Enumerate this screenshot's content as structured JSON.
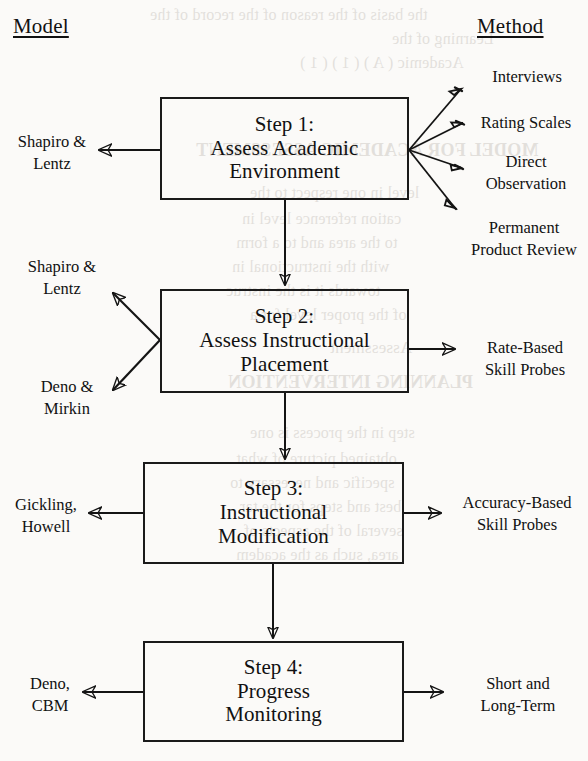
{
  "page": {
    "width": 588,
    "height": 761,
    "background_color": "#fbfaf8",
    "ink_color": "#141414"
  },
  "headers": {
    "left": "Model",
    "right": "Method"
  },
  "steps": [
    {
      "id": "step-1",
      "line1": "Step 1:",
      "line2": "Assess Academic",
      "line3": "Environment"
    },
    {
      "id": "step-2",
      "line1": "Step 2:",
      "line2": "Assess Instructional",
      "line3": "Placement"
    },
    {
      "id": "step-3",
      "line1": "Step 3:",
      "line2": "Instructional",
      "line3": "Modification"
    },
    {
      "id": "step-4",
      "line1": "Step 4:",
      "line2": "Progress",
      "line3": "Monitoring"
    }
  ],
  "model_labels": [
    {
      "id": "model-1",
      "line1": "Shapiro &",
      "line2": "Lentz"
    },
    {
      "id": "model-2",
      "line1": "Shapiro &",
      "line2": "Lentz"
    },
    {
      "id": "model-3",
      "line1": "Deno &",
      "line2": "Mirkin"
    },
    {
      "id": "model-4",
      "line1": "Gickling,",
      "line2": "Howell"
    },
    {
      "id": "model-5",
      "line1": "Deno,",
      "line2": "CBM"
    }
  ],
  "method_labels": [
    {
      "id": "method-1",
      "line1": "Interviews",
      "line2": ""
    },
    {
      "id": "method-2",
      "line1": "Rating Scales",
      "line2": ""
    },
    {
      "id": "method-3",
      "line1": "Direct",
      "line2": "Observation"
    },
    {
      "id": "method-4",
      "line1": "Permanent",
      "line2": "Product Review"
    },
    {
      "id": "method-5",
      "line1": "Rate-Based",
      "line2": "Skill Probes"
    },
    {
      "id": "method-6",
      "line1": "Accuracy-Based",
      "line2": "Skill Probes"
    },
    {
      "id": "method-7",
      "line1": "Short and",
      "line2": "Long-Term"
    }
  ],
  "bleed_text": {
    "note": "faint mirrored show-through text from the reverse side of the printed page",
    "lines": [
      {
        "text": "the basis of the reason of the record of the",
        "x": 150,
        "y": 6,
        "size": 16,
        "bold": false
      },
      {
        "text": "Learning of the",
        "x": 392,
        "y": 30,
        "size": 16,
        "bold": false
      },
      {
        "text": "Academic ( A ) ( 1 ) ( 1 )",
        "x": 300,
        "y": 54,
        "size": 16,
        "bold": false
      },
      {
        "text": "MODEL FOR ACADEMIC ASSESSMENT",
        "x": 196,
        "y": 140,
        "size": 18,
        "bold": true
      },
      {
        "text": "level in one respect to the",
        "x": 250,
        "y": 184,
        "size": 16,
        "bold": false
      },
      {
        "text": "cation reference level in",
        "x": 242,
        "y": 210,
        "size": 16,
        "bold": false
      },
      {
        "text": "to the area and to a form",
        "x": 236,
        "y": 234,
        "size": 16,
        "bold": false
      },
      {
        "text": "with the instructional in",
        "x": 232,
        "y": 258,
        "size": 16,
        "bold": false
      },
      {
        "text": "towards it is the instruc",
        "x": 226,
        "y": 282,
        "size": 16,
        "bold": false
      },
      {
        "text": "of the proper level for a",
        "x": 250,
        "y": 306,
        "size": 16,
        "bold": false
      },
      {
        "text": "Assessment",
        "x": 330,
        "y": 338,
        "size": 17,
        "bold": false
      },
      {
        "text": "PLANNING INTERVENTION",
        "x": 228,
        "y": 372,
        "size": 18,
        "bold": true
      },
      {
        "text": "step in the process is one",
        "x": 250,
        "y": 424,
        "size": 16,
        "bold": false
      },
      {
        "text": "obtained picture of what",
        "x": 236,
        "y": 450,
        "size": 16,
        "bold": false
      },
      {
        "text": "specific and necessary to",
        "x": 230,
        "y": 474,
        "size": 16,
        "bold": false
      },
      {
        "text": "best and steps for the tar",
        "x": 240,
        "y": 498,
        "size": 16,
        "bold": false
      },
      {
        "text": "several of the aspects of",
        "x": 244,
        "y": 522,
        "size": 16,
        "bold": false
      },
      {
        "text": "area, such as the academ",
        "x": 236,
        "y": 546,
        "size": 16,
        "bold": false
      }
    ]
  }
}
